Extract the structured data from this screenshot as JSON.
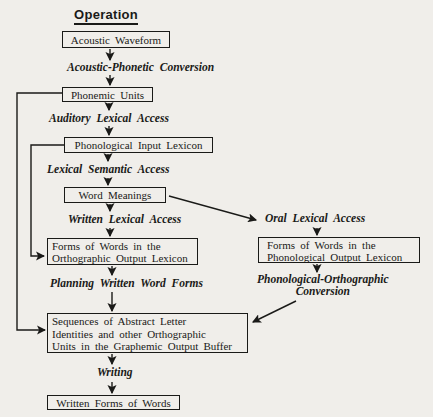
{
  "colors": {
    "ink": "#1a1a18",
    "paper": "#f0eeea"
  },
  "title": "Operation",
  "nodes": {
    "acoustic_waveform": {
      "label": "Acoustic Waveform"
    },
    "phonemic_units": {
      "label": "Phonemic Units"
    },
    "phonological_input_lexicon": {
      "label": "Phonological Input Lexicon"
    },
    "word_meanings": {
      "label": "Word Meanings"
    },
    "orthographic_output_lexicon": {
      "line1": "Forms of Words in the",
      "line2": "Orthographic Output Lexicon"
    },
    "phonological_output_lexicon": {
      "line1": "Forms of Words in the",
      "line2": "Phonological Output Lexicon"
    },
    "graphemic_output_buffer": {
      "line1": "Sequences of Abstract Letter",
      "line2": "Identities and other Orthographic",
      "line3": "Units in the Graphemic Output Buffer"
    },
    "written_forms_of_words": {
      "label": "Written Forms of Words"
    }
  },
  "process_labels": {
    "acoustic_phonetic_conversion": "Acoustic-Phonetic Conversion",
    "auditory_lexical_access": "Auditory Lexical Access",
    "lexical_semantic_access": "Lexical Semantic Access",
    "written_lexical_access": "Written Lexical Access",
    "oral_lexical_access": "Oral Lexical Access",
    "planning_written_word_forms": "Planning Written Word Forms",
    "phonological_orthographic_conversion": {
      "line1": "Phonological-Orthographic",
      "line2": "Conversion"
    },
    "writing": "Writing"
  }
}
